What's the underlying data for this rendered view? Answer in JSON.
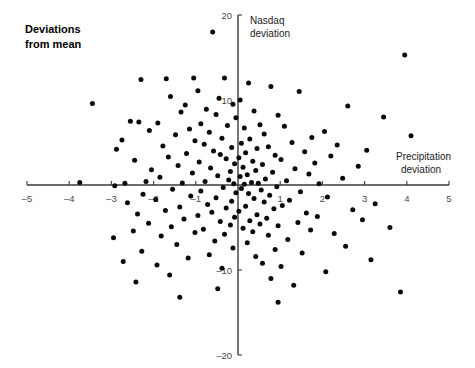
{
  "title": "Deviations\nfrom mean",
  "chart_data": {
    "type": "scatter",
    "title": "Deviations from mean",
    "xlabel": "Precipitation deviation",
    "ylabel": "Nasdaq deviation",
    "xlim": [
      -5,
      5
    ],
    "ylim": [
      -20,
      20
    ],
    "xticks": [
      -5,
      -4,
      -3,
      -2,
      -1,
      1,
      2,
      3,
      4,
      5
    ],
    "yticks": [
      20,
      10,
      -10,
      -20
    ],
    "xtick_labels": [
      "-5",
      "-4",
      "-3",
      "-2",
      "-1",
      "1",
      "2",
      "3",
      "4",
      "5"
    ],
    "ytick_labels": [
      "20",
      "10",
      "-10",
      "-20"
    ],
    "grid": false,
    "legend": "none",
    "axes_style": "crossed-at-origin",
    "marker": "filled-circle",
    "marker_color": "#0a0a0a",
    "n_points": 182,
    "points": [
      [
        -0.6,
        18.0
      ],
      [
        3.95,
        15.3
      ],
      [
        -1.05,
        12.6
      ],
      [
        -0.32,
        12.6
      ],
      [
        -1.7,
        12.5
      ],
      [
        -2.3,
        12.4
      ],
      [
        0.25,
        12.0
      ],
      [
        0.78,
        11.6
      ],
      [
        -0.95,
        11.1
      ],
      [
        1.45,
        11.0
      ],
      [
        -1.6,
        10.4
      ],
      [
        -0.45,
        10.2
      ],
      [
        0.05,
        10.0
      ],
      [
        -3.45,
        9.6
      ],
      [
        -1.25,
        9.4
      ],
      [
        -0.12,
        9.5
      ],
      [
        2.6,
        9.3
      ],
      [
        -0.75,
        8.9
      ],
      [
        -1.35,
        8.6
      ],
      [
        0.38,
        8.7
      ],
      [
        -0.52,
        8.3
      ],
      [
        0.95,
        8.2
      ],
      [
        3.45,
        8.0
      ],
      [
        -0.05,
        7.9
      ],
      [
        -2.55,
        7.5
      ],
      [
        -2.35,
        7.4
      ],
      [
        -1.9,
        7.3
      ],
      [
        -0.88,
        7.2
      ],
      [
        0.52,
        7.1
      ],
      [
        -0.25,
        7.0
      ],
      [
        1.1,
        6.9
      ],
      [
        0.15,
        6.7
      ],
      [
        -1.15,
        6.6
      ],
      [
        -2.1,
        6.4
      ],
      [
        2.05,
        6.3
      ],
      [
        -0.68,
        6.2
      ],
      [
        0.62,
        6.0
      ],
      [
        -1.48,
        5.9
      ],
      [
        4.1,
        5.8
      ],
      [
        1.75,
        5.6
      ],
      [
        -0.38,
        5.5
      ],
      [
        0.28,
        5.4
      ],
      [
        -2.75,
        5.3
      ],
      [
        -1.02,
        5.2
      ],
      [
        1.28,
        5.0
      ],
      [
        0.08,
        4.9
      ],
      [
        -0.8,
        4.8
      ],
      [
        2.35,
        4.7
      ],
      [
        -1.78,
        4.6
      ],
      [
        0.72,
        4.5
      ],
      [
        -0.15,
        4.4
      ],
      [
        0.45,
        4.3
      ],
      [
        -2.88,
        4.2
      ],
      [
        3.05,
        4.1
      ],
      [
        -0.58,
        4.0
      ],
      [
        1.58,
        3.9
      ],
      [
        0.18,
        3.8
      ],
      [
        -1.22,
        3.7
      ],
      [
        -0.42,
        3.6
      ],
      [
        0.88,
        3.5
      ],
      [
        2.2,
        3.4
      ],
      [
        -1.65,
        3.3
      ],
      [
        0.02,
        3.2
      ],
      [
        -0.28,
        3.1
      ],
      [
        1.02,
        3.0
      ],
      [
        -2.45,
        2.9
      ],
      [
        0.35,
        2.8
      ],
      [
        -0.92,
        2.7
      ],
      [
        1.82,
        2.6
      ],
      [
        -0.08,
        2.5
      ],
      [
        0.58,
        2.4
      ],
      [
        -1.42,
        2.3
      ],
      [
        2.85,
        2.2
      ],
      [
        0.12,
        2.1
      ],
      [
        -0.65,
        2.0
      ],
      [
        1.35,
        1.9
      ],
      [
        -2.05,
        1.8
      ],
      [
        0.42,
        1.7
      ],
      [
        -0.18,
        1.6
      ],
      [
        0.82,
        1.5
      ],
      [
        -1.08,
        1.4
      ],
      [
        1.68,
        1.3
      ],
      [
        0.22,
        1.2
      ],
      [
        -0.48,
        1.1
      ],
      [
        0.05,
        1.0
      ],
      [
        -1.85,
        0.9
      ],
      [
        2.48,
        0.8
      ],
      [
        0.65,
        0.7
      ],
      [
        -0.22,
        0.6
      ],
      [
        1.15,
        0.5
      ],
      [
        -0.78,
        0.4
      ],
      [
        0.32,
        0.3
      ],
      [
        -1.32,
        0.25
      ],
      [
        0.48,
        0.2
      ],
      [
        -0.1,
        0.15
      ],
      [
        0.15,
        0.1
      ],
      [
        -2.68,
        0.2
      ],
      [
        -3.75,
        0.3
      ],
      [
        -2.18,
        0.4
      ],
      [
        -2.92,
        -0.1
      ],
      [
        1.92,
        0.15
      ],
      [
        0.92,
        -0.2
      ],
      [
        -0.35,
        -0.3
      ],
      [
        0.08,
        -0.4
      ],
      [
        -1.55,
        -0.5
      ],
      [
        0.55,
        -0.6
      ],
      [
        -0.88,
        -0.7
      ],
      [
        1.48,
        -0.8
      ],
      [
        -0.05,
        -0.9
      ],
      [
        0.25,
        -1.0
      ],
      [
        -2.25,
        -1.1
      ],
      [
        0.75,
        -1.2
      ],
      [
        -1.12,
        -1.3
      ],
      [
        2.12,
        -1.4
      ],
      [
        -0.52,
        -1.5
      ],
      [
        0.38,
        -1.6
      ],
      [
        -1.95,
        -1.7
      ],
      [
        1.22,
        -1.8
      ],
      [
        -0.15,
        -1.9
      ],
      [
        0.62,
        -2.0
      ],
      [
        -2.62,
        -2.1
      ],
      [
        3.25,
        -2.2
      ],
      [
        -0.72,
        -2.3
      ],
      [
        1.05,
        -2.4
      ],
      [
        0.18,
        -2.5
      ],
      [
        -1.38,
        -2.6
      ],
      [
        -0.28,
        -2.7
      ],
      [
        0.85,
        -2.8
      ],
      [
        2.72,
        -2.9
      ],
      [
        -1.72,
        -3.0
      ],
      [
        0.02,
        -3.1
      ],
      [
        -0.62,
        -3.2
      ],
      [
        1.62,
        -3.3
      ],
      [
        -2.38,
        -3.4
      ],
      [
        0.45,
        -3.5
      ],
      [
        -0.95,
        -3.6
      ],
      [
        1.88,
        -3.7
      ],
      [
        -0.08,
        -3.8
      ],
      [
        0.68,
        -3.9
      ],
      [
        -1.28,
        -4.0
      ],
      [
        2.95,
        -4.1
      ],
      [
        0.28,
        -4.2
      ],
      [
        -0.42,
        -4.3
      ],
      [
        1.42,
        -4.4
      ],
      [
        -2.12,
        -4.5
      ],
      [
        0.52,
        -4.6
      ],
      [
        -0.18,
        -4.7
      ],
      [
        0.95,
        -4.8
      ],
      [
        -1.58,
        -4.9
      ],
      [
        3.6,
        -5.0
      ],
      [
        0.12,
        -5.1
      ],
      [
        -0.82,
        -5.2
      ],
      [
        1.72,
        -5.3
      ],
      [
        -2.48,
        -5.4
      ],
      [
        0.35,
        -5.5
      ],
      [
        -1.02,
        -5.6
      ],
      [
        2.28,
        -5.7
      ],
      [
        -0.32,
        -5.8
      ],
      [
        0.72,
        -5.9
      ],
      [
        -1.82,
        -6.0
      ],
      [
        -2.95,
        -6.2
      ],
      [
        1.18,
        -6.4
      ],
      [
        -0.55,
        -6.6
      ],
      [
        0.22,
        -6.8
      ],
      [
        -1.45,
        -7.0
      ],
      [
        2.55,
        -7.2
      ],
      [
        -0.12,
        -7.4
      ],
      [
        0.88,
        -7.6
      ],
      [
        -2.28,
        -7.8
      ],
      [
        1.52,
        -8.0
      ],
      [
        -0.68,
        -8.2
      ],
      [
        0.42,
        -8.4
      ],
      [
        -1.18,
        -8.6
      ],
      [
        3.15,
        -8.8
      ],
      [
        -2.72,
        -9.0
      ],
      [
        0.58,
        -9.2
      ],
      [
        -1.92,
        -9.4
      ],
      [
        1.02,
        -9.6
      ],
      [
        -0.38,
        -9.8
      ],
      [
        2.08,
        -10.2
      ],
      [
        -1.62,
        -10.6
      ],
      [
        0.78,
        -11.0
      ],
      [
        -2.42,
        -11.4
      ],
      [
        1.32,
        -11.8
      ],
      [
        -0.48,
        -12.2
      ],
      [
        3.85,
        -12.6
      ],
      [
        -1.38,
        -13.2
      ],
      [
        0.95,
        -13.8
      ]
    ]
  },
  "axis_labels": {
    "x": "Precipitation deviation",
    "y": "Nasdaq deviation"
  }
}
